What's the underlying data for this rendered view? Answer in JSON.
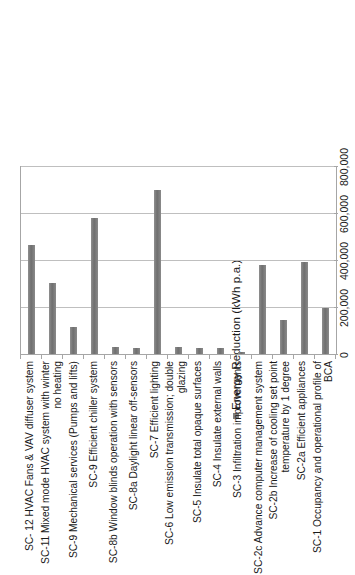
{
  "legend": {
    "entries": [
      {
        "label": "Energy Reduction (kWh p.a.)",
        "color": "#7f7f7f",
        "marker": "square-marker"
      }
    ]
  },
  "chart_data": {
    "type": "bar",
    "orientation": "horizontal",
    "title": "",
    "xlabel": "",
    "ylabel": "",
    "xlim": [
      0,
      800000
    ],
    "grid": true,
    "legend_position": "top-right",
    "series_name": "Energy Reduction (kWh p.a.)",
    "series_color": "#7f7f7f",
    "tick_labels": [
      "0",
      "200,000",
      "400,000",
      "600,000",
      "800,000"
    ],
    "tick_values": [
      0,
      200000,
      400000,
      600000,
      800000
    ],
    "categories": [
      "SC- 12 HVAC Fans & VAV diffuser system",
      "SC-11 Mixed mode HVAC system with winter no heating",
      "SC-9 Mechanical services (Pumps and lifts)",
      "SC-9 Efficient chiller system",
      "SC-8b Window blinds operation with sensors",
      "SC-8a Daylight linear off-sensors",
      "SC-7 Efficient lighting",
      "SC-6 Low emission transmission; double glazing",
      "SC-5 Insulate total opaque surfaces",
      "SC-4 Insulate external walls",
      "SC-3 Infiltration improvements",
      "SC-2c Advance computer management system",
      "SC-2b Increase of cooling set point temperature by 1 degree",
      "SC-2a Efficient appliances",
      "SC-1 Occupancy and operational profile of BCA"
    ],
    "values": [
      468000,
      306000,
      119000,
      583000,
      34000,
      30000,
      702000,
      34000,
      30000,
      30000,
      13000,
      383000,
      149000,
      396000,
      200000
    ]
  }
}
